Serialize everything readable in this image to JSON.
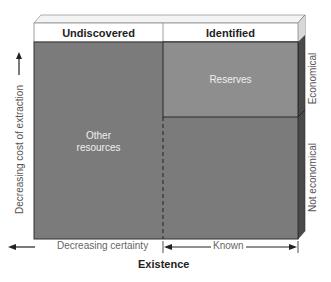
{
  "diagram": {
    "columns": {
      "left_header": "Undiscovered",
      "right_header": "Identified"
    },
    "regions": {
      "reserves": "Reserves",
      "other_resources_line1": "Other",
      "other_resources_line2": "resources"
    },
    "right_labels": {
      "top": "Economical",
      "bottom": "Not economical"
    },
    "y_axis": {
      "label": "Decreasing cost of extraction",
      "direction": "up"
    },
    "x_axis": {
      "left_segment": "Decreasing certainty",
      "right_segment": "Known",
      "title": "Existence"
    },
    "colors": {
      "body_fill": "#7b7b7b",
      "reserves_fill": "#8e8e8e",
      "header_fill": "#ffffff",
      "side_dark": "#4a4a4a",
      "border": "#333333"
    }
  }
}
